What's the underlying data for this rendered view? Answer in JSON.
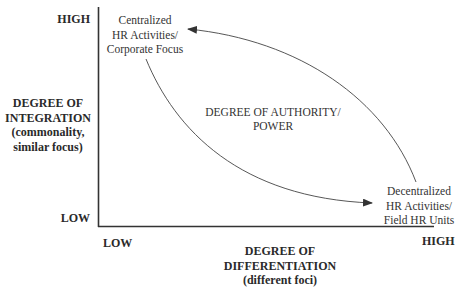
{
  "y_axis": {
    "high_label": "HIGH",
    "low_label": "LOW",
    "title_lines": [
      "DEGREE OF",
      "INTEGRATION",
      "(commonality,",
      "similar focus)"
    ]
  },
  "x_axis": {
    "low_label": "LOW",
    "high_label": "HIGH",
    "title_lines": [
      "DEGREE OF",
      "DIFFERENTIATION",
      "(different foci)"
    ]
  },
  "nodes": {
    "centralized": {
      "lines": [
        "Centralized",
        "HR Activities/",
        "Corporate Focus"
      ]
    },
    "decentralized": {
      "lines": [
        "Decentralized",
        "HR Activities/",
        "Field HR Units"
      ]
    }
  },
  "center_label": {
    "lines": [
      "DEGREE OF AUTHORITY/",
      "POWER"
    ]
  },
  "arrows": [
    {
      "from": "centralized",
      "to": "decentralized",
      "shape": "curve-down"
    },
    {
      "from": "decentralized",
      "to": "centralized",
      "shape": "curve-up"
    }
  ],
  "colors": {
    "line": "#333333",
    "text": "#2a2a2a"
  }
}
